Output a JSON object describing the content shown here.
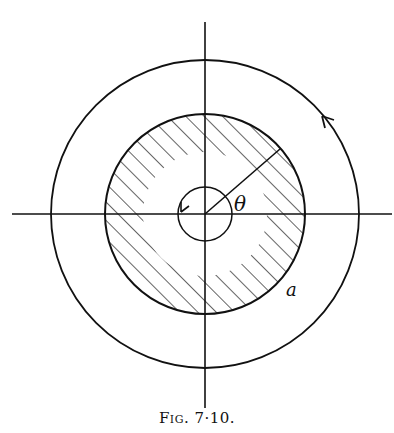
{
  "figure": {
    "caption": "Fig. 7·10.",
    "labels": {
      "angle": "θ",
      "radius": "a"
    },
    "geometry": {
      "center": [
        205,
        214
      ],
      "outer_contour_radius": 154,
      "disk_radius": 100,
      "small_contour_radius": 27,
      "hatched_region": "annulus between small contour and disk (cross-section of radius a)"
    },
    "elements": [
      "horizontal axis",
      "vertical axis",
      "outer circular contour with counter-clockwise arrow",
      "hatched disk of radius a",
      "small circular contour around origin with counter-clockwise arrow",
      "radius line at angle theta"
    ],
    "colors": {
      "ink": "#111111",
      "background": "#ffffff"
    }
  }
}
